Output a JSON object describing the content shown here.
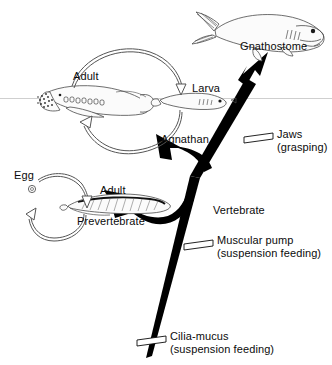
{
  "figure": {
    "background_color": "#ffffff",
    "ink_color": "#0b0b0b",
    "branch_color": "#000000",
    "outline_color": "#4a4a4a",
    "waterline_color": "#c8c8c8"
  },
  "taxa": {
    "gnathostome": "Gnathostome",
    "agnathan": "Agnathan",
    "prevertebrate": "Prevertebrate"
  },
  "lifecycle_lamprey": {
    "adult": "Adult",
    "larva": "Larva"
  },
  "lifecycle_prevertebrate": {
    "egg": "Egg",
    "adult": "Adult"
  },
  "characters": [
    {
      "id": "jaws",
      "name": "Jaws",
      "qualifier": "(grasping)",
      "node": "gnathostome-branch"
    },
    {
      "id": "muscular-pump",
      "name": "Muscular pump",
      "qualifier": "(suspension feeding)",
      "node": "vertebrate-stem"
    },
    {
      "id": "cilia-mucus",
      "name": "Cilia-mucus",
      "qualifier": "(suspension feeding)",
      "node": "basal-stem"
    }
  ],
  "clades": {
    "vertebrate": "Vertebrate"
  },
  "icons": {
    "egg": "egg-icon",
    "cycle_arrow": "cycle-arrow-icon",
    "character_tick": "character-tick-icon"
  }
}
